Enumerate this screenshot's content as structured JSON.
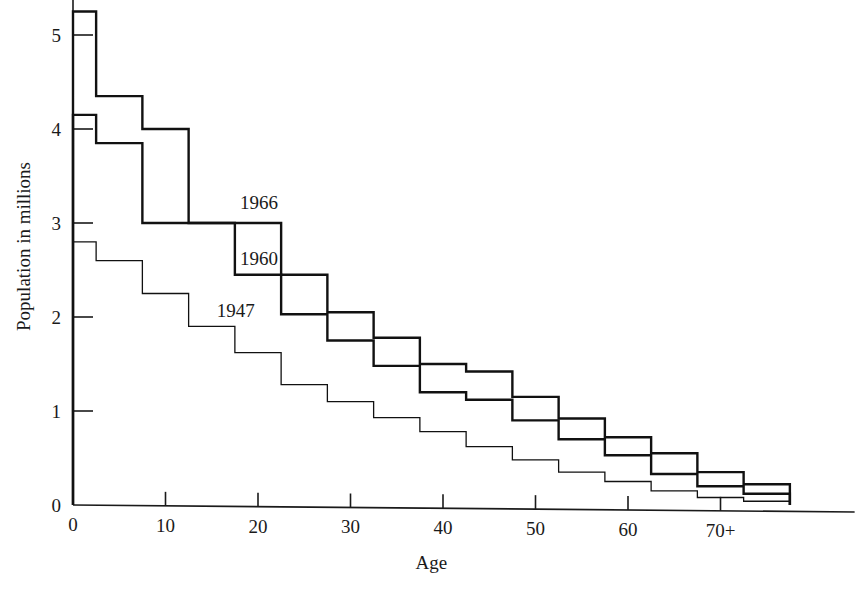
{
  "figure": {
    "title": "",
    "caption_fragment": ""
  },
  "axes": {
    "x_title": "Age",
    "y_title": "Population in millions",
    "x_ticks": [
      "0",
      "10",
      "20",
      "30",
      "40",
      "50",
      "60",
      "70+"
    ],
    "y_ticks": [
      "0",
      "1",
      "2",
      "3",
      "4",
      "5"
    ]
  },
  "series_labels": {
    "s1966": "1966",
    "s1960": "1960",
    "s1947": "1947"
  },
  "colors": {
    "ink": "#111111",
    "axis": "#1a1a1a",
    "background": "#ffffff"
  },
  "chart_data": {
    "type": "line",
    "subtype": "step-histogram",
    "title": "",
    "xlabel": "Age",
    "ylabel": "Population in millions",
    "xlim": [
      0,
      77.5
    ],
    "ylim": [
      0,
      5.5
    ],
    "x_ticks": [
      0,
      10,
      20,
      30,
      40,
      50,
      60,
      70
    ],
    "x_tick_labels": [
      "0",
      "10",
      "20",
      "30",
      "40",
      "50",
      "60",
      "70+"
    ],
    "y_ticks": [
      0,
      1,
      2,
      3,
      4,
      5
    ],
    "y_tick_labels": [
      "0",
      "1",
      "2",
      "3",
      "4",
      "5"
    ],
    "grid": false,
    "legend": "inline-annotations",
    "bin_edges": [
      0,
      2.5,
      7.5,
      12.5,
      17.5,
      22.5,
      27.5,
      32.5,
      37.5,
      42.5,
      47.5,
      52.5,
      57.5,
      62.5,
      67.5,
      72.5,
      77.5
    ],
    "series": [
      {
        "name": "1966",
        "stroke_width": 2.4,
        "values": [
          5.25,
          4.35,
          4.0,
          3.0,
          3.0,
          2.45,
          2.05,
          1.78,
          1.5,
          1.42,
          1.15,
          0.92,
          0.72,
          0.55,
          0.35,
          0.22
        ]
      },
      {
        "name": "1960",
        "stroke_width": 2.4,
        "values": [
          4.15,
          3.85,
          3.0,
          3.0,
          2.45,
          2.03,
          1.75,
          1.48,
          1.2,
          1.12,
          0.9,
          0.7,
          0.53,
          0.33,
          0.2,
          0.12
        ]
      },
      {
        "name": "1947",
        "stroke_width": 1.3,
        "values": [
          2.8,
          2.6,
          2.25,
          1.9,
          1.62,
          1.28,
          1.1,
          0.93,
          0.78,
          0.62,
          0.48,
          0.35,
          0.25,
          0.15,
          0.08,
          0.04
        ]
      }
    ],
    "annotations": [
      {
        "text": "1966",
        "x": 17.5,
        "y": 3.15,
        "anchor": "start"
      },
      {
        "text": "1960",
        "x": 17.5,
        "y": 2.55,
        "anchor": "start"
      },
      {
        "text": "1947",
        "x": 15.0,
        "y": 2.0,
        "anchor": "start"
      }
    ]
  }
}
